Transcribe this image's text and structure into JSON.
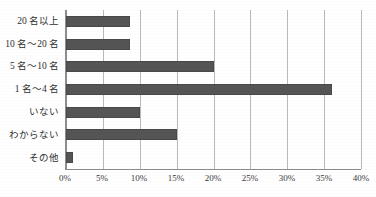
{
  "figure": {
    "cut_off_caption": "",
    "background_color": "#ffffff",
    "bar_color": "#555555",
    "gridline_color": "#b9b9b9",
    "axis_color": "#8d8d8d"
  },
  "chart_data": {
    "type": "bar",
    "orientation": "horizontal",
    "title": "",
    "xlabel": "",
    "ylabel": "",
    "categories": [
      "20 名以上",
      "10 名～20 名",
      "5 名～10 名",
      "1 名～4 名",
      "いない",
      "わからない",
      "その他"
    ],
    "values": [
      8.7,
      8.7,
      20.0,
      36.0,
      10.0,
      15.0,
      1.0
    ],
    "value_unit": "%",
    "xlim": [
      0,
      40
    ],
    "xtick_step": 5,
    "xtick_labels": [
      "0%",
      "5%",
      "10%",
      "15%",
      "20%",
      "25%",
      "30%",
      "35%",
      "40%"
    ],
    "xtick_values": [
      0,
      5,
      10,
      15,
      20,
      25,
      30,
      35,
      40
    ],
    "grid": "vertical",
    "legend": "none"
  }
}
